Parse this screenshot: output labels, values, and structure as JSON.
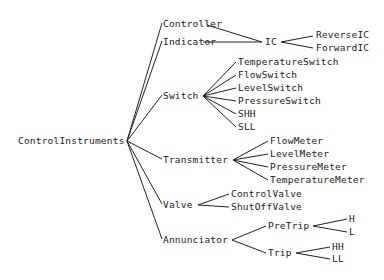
{
  "diagram": {
    "type": "tree",
    "root": {
      "id": "root",
      "label": "ControlInstruments",
      "x": 18,
      "y": 144,
      "jx": 127,
      "jy": 141
    },
    "nodes": [
      {
        "id": "controller",
        "label": "Controller",
        "x": 163,
        "y": 27,
        "ax": 162,
        "ay": 23,
        "parent": "root"
      },
      {
        "id": "indicator",
        "label": "Indicator",
        "x": 163,
        "y": 45,
        "ax": 162,
        "ay": 41,
        "parent": "root"
      },
      {
        "id": "switch",
        "label": "Switch",
        "x": 163,
        "y": 99,
        "ax": 162,
        "ay": 95,
        "parent": "root",
        "jx": 203,
        "jy": 96
      },
      {
        "id": "transmitter",
        "label": "Transmitter",
        "x": 163,
        "y": 163,
        "ax": 162,
        "ay": 159,
        "parent": "root",
        "jx": 233,
        "jy": 160
      },
      {
        "id": "valve",
        "label": "Valve",
        "x": 163,
        "y": 208,
        "ax": 162,
        "ay": 204,
        "parent": "root",
        "jx": 198,
        "jy": 205
      },
      {
        "id": "annunciator",
        "label": "Annunciator",
        "x": 163,
        "y": 243,
        "ax": 162,
        "ay": 239,
        "parent": "root",
        "jx": 232,
        "jy": 240
      },
      {
        "id": "ic",
        "label": "IC",
        "x": 265,
        "y": 45,
        "ax": 263,
        "ay": 42,
        "jx": 281,
        "jy": 42
      },
      {
        "id": "reverseic",
        "label": "ReverseIC",
        "x": 316,
        "y": 38,
        "ax": 313,
        "ay": 36,
        "parent": "ic"
      },
      {
        "id": "forwardic",
        "label": "ForwardIC",
        "x": 316,
        "y": 51,
        "ax": 313,
        "ay": 48,
        "parent": "ic"
      },
      {
        "id": "temperatureswitch",
        "label": "TemperatureSwitch",
        "x": 238,
        "y": 65,
        "ax": 236,
        "ay": 62,
        "parent": "switch"
      },
      {
        "id": "flowswitch",
        "label": "FlowSwitch",
        "x": 238,
        "y": 78,
        "ax": 236,
        "ay": 75,
        "parent": "switch"
      },
      {
        "id": "levelswitch",
        "label": "LevelSwitch",
        "x": 238,
        "y": 91,
        "ax": 236,
        "ay": 88,
        "parent": "switch"
      },
      {
        "id": "pressureswitch",
        "label": "PressureSwitch",
        "x": 238,
        "y": 104,
        "ax": 236,
        "ay": 101,
        "parent": "switch"
      },
      {
        "id": "shh",
        "label": "SHH",
        "x": 238,
        "y": 117,
        "ax": 236,
        "ay": 114,
        "parent": "switch"
      },
      {
        "id": "sll",
        "label": "SLL",
        "x": 238,
        "y": 130,
        "ax": 236,
        "ay": 127,
        "parent": "switch"
      },
      {
        "id": "flowmeter",
        "label": "FlowMeter",
        "x": 270,
        "y": 144,
        "ax": 268,
        "ay": 141,
        "parent": "transmitter"
      },
      {
        "id": "levelmeter",
        "label": "LevelMeter",
        "x": 270,
        "y": 157,
        "ax": 268,
        "ay": 154,
        "parent": "transmitter"
      },
      {
        "id": "pressuremeter",
        "label": "PressureMeter",
        "x": 270,
        "y": 170,
        "ax": 268,
        "ay": 167,
        "parent": "transmitter"
      },
      {
        "id": "temperaturemeter",
        "label": "TemperatureMeter",
        "x": 270,
        "y": 183,
        "ax": 268,
        "ay": 180,
        "parent": "transmitter"
      },
      {
        "id": "controlvalve",
        "label": "ControlValve",
        "x": 231,
        "y": 197,
        "ax": 229,
        "ay": 194,
        "parent": "valve"
      },
      {
        "id": "shutoffvalve",
        "label": "ShutOffValve",
        "x": 231,
        "y": 210,
        "ax": 229,
        "ay": 207,
        "parent": "valve"
      },
      {
        "id": "pretrip",
        "label": "PreTrip",
        "x": 268,
        "y": 229,
        "ax": 266,
        "ay": 226,
        "parent": "annunciator",
        "jx": 313,
        "jy": 226
      },
      {
        "id": "trip",
        "label": "Trip",
        "x": 268,
        "y": 256,
        "ax": 266,
        "ay": 253,
        "parent": "annunciator",
        "jx": 296,
        "jy": 253
      },
      {
        "id": "h",
        "label": "H",
        "x": 349,
        "y": 222,
        "ax": 347,
        "ay": 219,
        "parent": "pretrip"
      },
      {
        "id": "l",
        "label": "L",
        "x": 349,
        "y": 235,
        "ax": 347,
        "ay": 232,
        "parent": "pretrip"
      },
      {
        "id": "hh",
        "label": "HH",
        "x": 332,
        "y": 250,
        "ax": 330,
        "ay": 247,
        "parent": "trip"
      },
      {
        "id": "ll",
        "label": "LL",
        "x": 332,
        "y": 262,
        "ax": 330,
        "ay": 259,
        "parent": "trip"
      }
    ],
    "edges_extra": [
      {
        "from": "controller",
        "to": "ic",
        "x1": 207,
        "y1": 25,
        "x2": 262,
        "y2": 42
      },
      {
        "from": "indicator",
        "to": "ic",
        "x1": 203,
        "y1": 42,
        "x2": 262,
        "y2": 42
      }
    ]
  }
}
